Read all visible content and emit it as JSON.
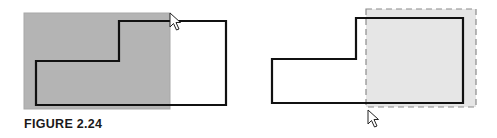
{
  "figure": {
    "caption": "FIGURE 2.24",
    "panels": [
      {
        "name": "left-panel",
        "description": "Drag from bottom-left to top-right; gray selection rectangle partially overlaps shape",
        "selection_rect": {
          "x": 24,
          "y": 13,
          "w": 146,
          "h": 96,
          "fill": "#b4b4b4",
          "stroke": "#a8a8a8"
        },
        "shape_points": "36,105 36,61 119,61 119,21 226,21 226,105",
        "cursor": {
          "x": 170,
          "y": 13
        }
      },
      {
        "name": "right-panel",
        "description": "Drag from bottom-left toward top-right; dashed crossing selection rectangle",
        "selection_rect": {
          "x": 366,
          "y": 9,
          "w": 110,
          "h": 98,
          "fill": "#e6e6e6",
          "stroke": "#8c8c8c"
        },
        "shape_points": "272,103 272,59 356,59 356,18 463,18 463,103",
        "cursor": {
          "x": 368,
          "y": 110
        }
      }
    ]
  }
}
